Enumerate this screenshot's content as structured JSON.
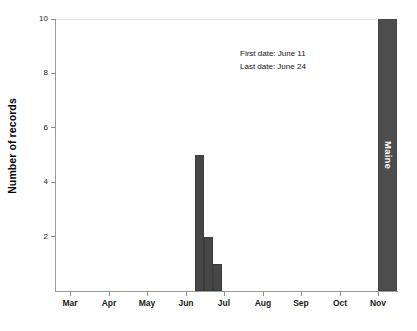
{
  "chart_data": {
    "type": "bar",
    "title": "",
    "subtitle": "",
    "xlabel": "",
    "ylabel": "Number of records",
    "ylim": [
      0,
      10
    ],
    "yticks": [
      2,
      4,
      6,
      8,
      10
    ],
    "ytick_labels": [
      "2",
      "4",
      "6",
      "8",
      "10"
    ],
    "xtick_labels": [
      "Mar",
      "Apr",
      "May",
      "Jun",
      "Jul",
      "Aug",
      "Sep",
      "Oct",
      "Nov"
    ],
    "xlim_labels": [
      "Mar",
      "Nov"
    ],
    "grid": false,
    "legend": false,
    "bar_color": "#474747",
    "categories": [
      "Jun wk2",
      "Jun wk3",
      "Jun wk4"
    ],
    "values": [
      5,
      2,
      1
    ],
    "bars": [
      {
        "label": "Jun wk2",
        "value": 5
      },
      {
        "label": "Jun wk3",
        "value": 2
      },
      {
        "label": "Jun wk4",
        "value": 1
      }
    ],
    "region_bar": {
      "label": "Maine",
      "value": 10,
      "color": "#4d4d4d",
      "label_color": "#ffffff"
    },
    "annotations": [
      "First date: June 11",
      "Last date: June 24"
    ],
    "annotation_lines": {
      "first_date": "First date: June 11",
      "last_date": "Last date: June 24"
    }
  }
}
